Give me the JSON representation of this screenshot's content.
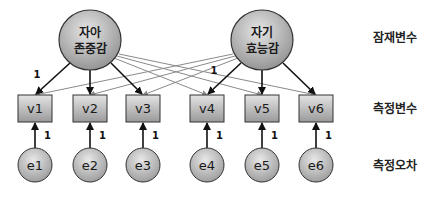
{
  "latent_variables": [
    {
      "id": "self_esteem",
      "line1": "자아",
      "line2": "존중감",
      "cx": 90,
      "cy": 40
    },
    {
      "id": "self_efficacy",
      "line1": "자기",
      "line2": "효능감",
      "cx": 262,
      "cy": 40
    }
  ],
  "observed_variables": [
    {
      "id": "v1",
      "label": "v1",
      "x": 18
    },
    {
      "id": "v2",
      "label": "v2",
      "x": 73
    },
    {
      "id": "v3",
      "label": "v3",
      "x": 126
    },
    {
      "id": "v4",
      "label": "v4",
      "x": 190
    },
    {
      "id": "v5",
      "label": "v5",
      "x": 245
    },
    {
      "id": "v6",
      "label": "v6",
      "x": 299
    }
  ],
  "errors": [
    {
      "id": "e1",
      "label": "e1",
      "weight": "1"
    },
    {
      "id": "e2",
      "label": "e2",
      "weight": "1"
    },
    {
      "id": "e3",
      "label": "e3",
      "weight": "1"
    },
    {
      "id": "e4",
      "label": "e4",
      "weight": "1"
    },
    {
      "id": "e5",
      "label": "e5",
      "weight": "1"
    },
    {
      "id": "e6",
      "label": "e6",
      "weight": "1"
    }
  ],
  "fixed_loadings": [
    {
      "from": "자아 존중감",
      "to": "v1",
      "value": "1"
    },
    {
      "from": "자기 효능감",
      "to": "v4",
      "value": "1"
    }
  ],
  "main_paths": [
    {
      "from": "자아 존중감",
      "to": [
        "v1",
        "v2",
        "v3"
      ]
    },
    {
      "from": "자기 효능감",
      "to": [
        "v4",
        "v5",
        "v6"
      ]
    }
  ],
  "cross_paths": [
    {
      "from": "자아 존중감",
      "to": [
        "v4",
        "v5",
        "v6"
      ]
    },
    {
      "from": "자기 효능감",
      "to": [
        "v1",
        "v2",
        "v3"
      ]
    }
  ],
  "row_labels": {
    "latent": "잠재변수",
    "observed": "측정변수",
    "error": "측정오차"
  },
  "colors": {
    "node_fill_light": "#d9d9d9",
    "node_fill_dark": "#8c8c8c",
    "stroke": "#333333",
    "main_arrow": "#111111",
    "cross_line": "#8a8a8a"
  }
}
